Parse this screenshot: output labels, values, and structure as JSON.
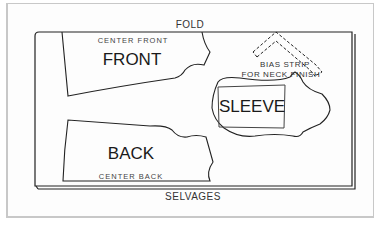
{
  "diagram": {
    "type": "sewing pattern layout",
    "labels": {
      "fold": "FOLD",
      "selvages": "SELVAGES",
      "center_front": "CENTER FRONT",
      "front": "FRONT",
      "back": "BACK",
      "center_back": "CENTER BACK",
      "sleeve": "SLEEVE",
      "bias_strip_line1": "BIAS STRIP",
      "bias_strip_line2": "FOR NECK FINISH"
    },
    "pieces": [
      {
        "name": "FRONT",
        "annotation": "CENTER FRONT",
        "placement": "top-left, on fold"
      },
      {
        "name": "BACK",
        "annotation": "CENTER BACK",
        "placement": "bottom-left, on selvages"
      },
      {
        "name": "SLEEVE",
        "placement": "center-right"
      },
      {
        "name": "BIAS STRIP FOR NECK FINISH",
        "placement": "top-right, chevron, dashed"
      }
    ],
    "colors": {
      "line": "#222222",
      "frame": "#c8c8c8",
      "background": "#ffffff"
    }
  }
}
